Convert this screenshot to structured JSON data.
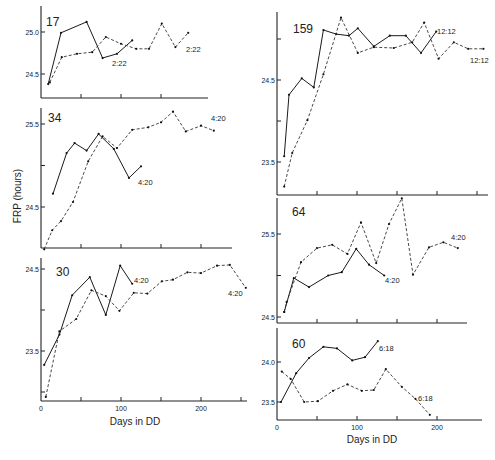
{
  "figure": {
    "ylabel": "FRP (hours)",
    "xlabel_left": "Days in DD",
    "xlabel_right": "Days in DD"
  },
  "chart_data": [
    {
      "type": "line",
      "panel_label": "17",
      "xlabel": "",
      "ylabel": "FRP (hours)",
      "yticks": [
        24.5,
        25.0
      ],
      "xticks": [
        0,
        50,
        100,
        150
      ],
      "xlim": [
        0,
        210
      ],
      "ylim": [
        24.3,
        25.2
      ],
      "series": [
        {
          "name": "solid",
          "style": "solid",
          "end_label": "2:22",
          "x": [
            9,
            25,
            57,
            77,
            95,
            114
          ],
          "y": [
            24.38,
            24.99,
            25.12,
            24.69,
            24.74,
            24.9
          ]
        },
        {
          "name": "dashed",
          "style": "dashed",
          "end_label": "2:22",
          "x": [
            11,
            26,
            45,
            64,
            81,
            100,
            119,
            135,
            151,
            168,
            184
          ],
          "y": [
            24.4,
            24.7,
            24.74,
            24.76,
            24.94,
            24.86,
            24.8,
            24.8,
            25.1,
            24.82,
            24.99
          ]
        }
      ]
    },
    {
      "type": "line",
      "panel_label": "34",
      "xlabel": "",
      "ylabel": "FRP (hours)",
      "yticks": [
        24.5,
        25.0,
        25.5
      ],
      "ytick_labels": [
        "24.5",
        "",
        "25.5"
      ],
      "xticks": [
        0,
        50,
        100,
        150,
        200
      ],
      "xlim": [
        0,
        240
      ],
      "ylim": [
        24.0,
        25.65
      ],
      "series": [
        {
          "name": "solid",
          "style": "solid",
          "end_label": "4:20",
          "x": [
            15,
            32,
            42,
            57,
            72,
            91,
            110,
            125
          ],
          "y": [
            24.66,
            25.15,
            25.27,
            25.18,
            25.38,
            25.2,
            24.85,
            24.99
          ]
        },
        {
          "name": "dashed",
          "style": "dashed",
          "end_label": "4:20",
          "x": [
            4,
            14,
            25,
            40,
            59,
            77,
            95,
            114,
            134,
            150,
            165,
            181,
            200,
            216
          ],
          "y": [
            23.99,
            24.22,
            24.33,
            24.56,
            25.05,
            25.35,
            25.21,
            25.43,
            25.46,
            25.52,
            25.65,
            25.41,
            25.48,
            25.42
          ]
        }
      ]
    },
    {
      "type": "line",
      "panel_label": "30",
      "xlabel": "Days in DD",
      "ylabel": "FRP (hours)",
      "yticks": [
        23.0,
        23.5,
        24.0,
        24.5
      ],
      "ytick_labels": [
        "",
        "23.5",
        "",
        "24.5"
      ],
      "xticks": [
        0,
        50,
        100,
        150,
        200,
        250
      ],
      "xtick_labels": [
        "0",
        "",
        "100",
        "",
        "200",
        ""
      ],
      "xlim": [
        0,
        260
      ],
      "ylim": [
        22.9,
        24.6
      ],
      "series": [
        {
          "name": "solid",
          "style": "solid",
          "end_label": "4:20",
          "x": [
            4,
            23,
            39,
            61,
            81,
            99,
            114
          ],
          "y": [
            23.33,
            23.7,
            24.18,
            24.4,
            23.94,
            24.54,
            24.32
          ]
        },
        {
          "name": "dashed",
          "style": "dashed",
          "end_label": "4:20",
          "x": [
            6,
            23,
            44,
            63,
            81,
            98,
            116,
            133,
            151,
            165,
            183,
            200,
            220,
            236,
            256
          ],
          "y": [
            22.94,
            23.74,
            23.89,
            24.24,
            24.17,
            23.99,
            24.21,
            24.2,
            24.35,
            24.37,
            24.46,
            24.45,
            24.54,
            24.55,
            24.27
          ]
        }
      ]
    },
    {
      "type": "line",
      "panel_label": "159",
      "xlabel": "",
      "ylabel": "",
      "yticks": [
        23.5,
        24.0,
        24.5,
        25.0
      ],
      "ytick_labels": [
        "23.5",
        "",
        "24.5",
        ""
      ],
      "xticks": [
        0,
        50,
        100,
        150,
        200,
        250
      ],
      "xlim": [
        0,
        260
      ],
      "ylim": [
        23.1,
        25.3
      ],
      "series": [
        {
          "name": "solid",
          "style": "solid",
          "end_label": "12:12",
          "x": [
            9,
            15,
            31,
            46,
            58,
            74,
            90,
            101,
            121,
            141,
            161,
            180,
            199
          ],
          "y": [
            23.57,
            24.32,
            24.52,
            24.41,
            25.11,
            25.06,
            25.04,
            25.13,
            24.91,
            25.04,
            25.04,
            24.83,
            25.09
          ]
        },
        {
          "name": "dashed",
          "style": "dashed",
          "end_label": "12:12",
          "x": [
            9,
            19,
            38,
            58,
            80,
            101,
            121,
            146,
            169,
            184,
            202,
            221,
            239,
            258
          ],
          "y": [
            23.2,
            23.61,
            24.01,
            24.57,
            25.26,
            24.83,
            24.9,
            24.89,
            24.96,
            25.2,
            24.76,
            24.96,
            24.88,
            24.88
          ]
        }
      ]
    },
    {
      "type": "line",
      "panel_label": "64",
      "xlabel": "",
      "ylabel": "",
      "yticks": [
        24.5,
        25.0,
        25.5
      ],
      "ytick_labels": [
        "24.5",
        "",
        "25.5"
      ],
      "xticks": [
        0,
        50,
        100,
        150,
        200
      ],
      "xlim": [
        0,
        235
      ],
      "ylim": [
        24.45,
        25.95
      ],
      "series": [
        {
          "name": "solid",
          "style": "solid",
          "end_label": "4:20",
          "x": [
            9,
            21,
            40,
            64,
            81,
            99,
            115,
            134
          ],
          "y": [
            24.56,
            24.97,
            24.86,
            25.0,
            25.04,
            25.32,
            25.13,
            25.0
          ]
        },
        {
          "name": "dashed",
          "style": "dashed",
          "end_label": "4:20",
          "x": [
            9,
            12,
            30,
            50,
            69,
            88,
            105,
            124,
            140,
            156,
            170,
            190,
            208,
            226
          ],
          "y": [
            24.56,
            24.68,
            25.16,
            25.33,
            25.37,
            25.26,
            25.64,
            25.15,
            25.62,
            25.93,
            25.01,
            25.34,
            25.4,
            25.33
          ]
        }
      ]
    },
    {
      "type": "line",
      "panel_label": "60",
      "xlabel": "Days in DD",
      "ylabel": "",
      "yticks": [
        23.5,
        24.0
      ],
      "xticks": [
        0,
        50,
        100,
        150,
        200
      ],
      "xtick_labels": [
        "0",
        "",
        "100",
        "",
        "200"
      ],
      "xlim": [
        0,
        250
      ],
      "ylim": [
        23.28,
        24.35
      ],
      "series": [
        {
          "name": "solid",
          "style": "solid",
          "end_label": "6:18",
          "x": [
            5,
            24,
            40,
            58,
            75,
            94,
            110,
            126
          ],
          "y": [
            23.5,
            23.86,
            24.05,
            24.19,
            24.17,
            24.02,
            24.06,
            24.26
          ]
        },
        {
          "name": "dashed",
          "style": "dashed",
          "end_label": "6:18",
          "x": [
            6,
            17,
            34,
            51,
            70,
            88,
            106,
            121,
            136,
            156,
            173,
            191
          ],
          "y": [
            23.88,
            23.79,
            23.5,
            23.51,
            23.64,
            23.72,
            23.64,
            23.65,
            23.91,
            23.69,
            23.54,
            23.34
          ]
        }
      ]
    }
  ],
  "layout": {
    "panels": [
      {
        "x0": 41,
        "xpx_per_day": 0.8,
        "axis_top": 6,
        "baseline": 98,
        "axis_right": 208,
        "yref": [
          25.0,
          32
        ],
        "ypx_per_hr": 84,
        "label_xy": [
          46,
          26
        ],
        "end_labels": [
          [
            112,
            66
          ],
          [
            186,
            52
          ]
        ]
      },
      {
        "x0": 41,
        "xpx_per_day": 0.8,
        "axis_top": 108,
        "baseline": 248,
        "axis_right": 232,
        "yref": [
          25.5,
          124
        ],
        "ypx_per_hr": 83,
        "label_xy": [
          48,
          122
        ],
        "end_labels": [
          [
            138,
            185
          ],
          [
            211,
            121
          ]
        ]
      },
      {
        "x0": 41,
        "xpx_per_day": 0.8,
        "axis_top": 258,
        "baseline": 401,
        "axis_right": 247,
        "yref": [
          24.5,
          269
        ],
        "ypx_per_hr": 82,
        "label_xy": [
          56,
          276
        ],
        "end_labels": [
          [
            134,
            283
          ],
          [
            228,
            296
          ]
        ]
      },
      {
        "x0": 277,
        "xpx_per_day": 0.8,
        "axis_top": 12,
        "baseline": 195,
        "axis_right": 488,
        "yref": [
          24.5,
          80
        ],
        "ypx_per_hr": 82,
        "label_xy": [
          293,
          33
        ],
        "end_labels": [
          [
            437,
            34
          ],
          [
            470,
            63
          ]
        ]
      },
      {
        "x0": 277,
        "xpx_per_day": 0.8,
        "axis_top": 198,
        "baseline": 323,
        "axis_right": 467,
        "yref": [
          25.5,
          234
        ],
        "ypx_per_hr": 83,
        "label_xy": [
          292,
          216
        ],
        "end_labels": [
          [
            385,
            283
          ],
          [
            451,
            240
          ]
        ]
      },
      {
        "x0": 277,
        "xpx_per_day": 0.8,
        "axis_top": 328,
        "baseline": 420,
        "axis_right": 482,
        "yref": [
          24.0,
          362
        ],
        "ypx_per_hr": 80,
        "label_xy": [
          292,
          348
        ],
        "end_labels": [
          [
            379,
            351
          ],
          [
            418,
            401
          ]
        ]
      }
    ],
    "ylabel_xy": [
      21,
      196
    ],
    "xlabel_left_xy": [
      135,
      425
    ],
    "xlabel_right_xy": [
      372,
      443
    ]
  }
}
